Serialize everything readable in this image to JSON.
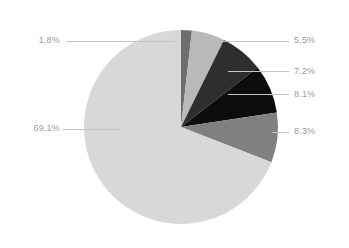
{
  "chart_data": {
    "type": "pie",
    "title": "",
    "subtitle": "",
    "xlabel": "",
    "ylabel": "",
    "legend_position": "none",
    "grid": false,
    "labels_format": "percent",
    "start_angle_deg": 0,
    "direction": "clockwise",
    "categories": [
      "69.1%",
      "1.8%",
      "5.5%",
      "7.2%",
      "8.1%",
      "8.3%"
    ],
    "values": [
      69.1,
      1.8,
      5.5,
      7.2,
      8.1,
      8.3
    ],
    "slices": [
      {
        "label": "69.1%",
        "value": 69.1,
        "color": "#d8d8d8",
        "label_side": "left",
        "order_clockwise_from_top": 6
      },
      {
        "label": "1.8%",
        "value": 1.8,
        "color": "#6e6e6e",
        "label_side": "left",
        "order_clockwise_from_top": 1
      },
      {
        "label": "5.5%",
        "value": 5.5,
        "color": "#b9b9b9",
        "label_side": "right",
        "order_clockwise_from_top": 2
      },
      {
        "label": "7.2%",
        "value": 7.2,
        "color": "#2e2e2e",
        "label_side": "right",
        "order_clockwise_from_top": 3
      },
      {
        "label": "8.1%",
        "value": 8.1,
        "color": "#0d0d0d",
        "label_side": "right",
        "order_clockwise_from_top": 4
      },
      {
        "label": "8.3%",
        "value": 8.3,
        "color": "#808080",
        "label_side": "right",
        "order_clockwise_from_top": 5
      }
    ],
    "colors": {
      "background": "#ffffff",
      "label_text": "#9a9a9a",
      "leader_line": "#c4c4c4"
    }
  }
}
